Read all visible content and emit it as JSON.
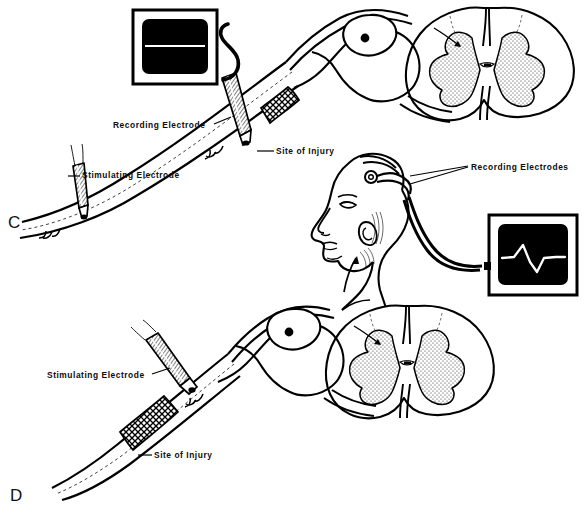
{
  "figure": {
    "background_color": "#ffffff",
    "ink_color": "#000000",
    "gray_matter_fill": "#d9d9d9",
    "screen_fill": "#000000",
    "trace_color": "#ffffff"
  },
  "panels": [
    {
      "id": "C",
      "letter": "C",
      "description": "Stimulating electrode distal to injury, recording electrode proximal on cord; flat oscilloscope trace",
      "oscilloscope": {
        "name": "flat-trace-oscilloscope",
        "trace_type": "flat",
        "trace_label": "no response"
      },
      "labels": [
        {
          "key": "recording_electrode",
          "text": "Recording Electrode"
        },
        {
          "key": "stimulating_electrode",
          "text": "Stimulating Electrode"
        },
        {
          "key": "site_of_injury",
          "text": "Site of Injury"
        }
      ]
    },
    {
      "id": "D",
      "letter": "D",
      "description": "Stimulating electrode proximal to injury; scalp recording electrodes show evoked response",
      "oscilloscope": {
        "name": "evoked-response-oscilloscope",
        "trace_type": "evoked-spike",
        "trace_label": "evoked potential"
      },
      "labels": [
        {
          "key": "stimulating_electrode",
          "text": "Stimulating Electrode"
        },
        {
          "key": "site_of_injury",
          "text": "Site of Injury"
        }
      ]
    }
  ],
  "head": {
    "name": "patient-head-profile",
    "label": "Recording Electrodes"
  },
  "label_text": {
    "recording_electrode": "Recording Electrode",
    "stimulating_electrode_c": "Stimulating Electrode",
    "site_of_injury_c": "Site of Injury",
    "recording_electrodes_head": "Recording Electrodes",
    "stimulating_electrode_d": "Stimulating Electrode",
    "site_of_injury_d": "Site of Injury",
    "panel_c": "C",
    "panel_d": "D"
  }
}
